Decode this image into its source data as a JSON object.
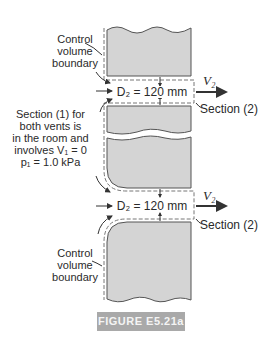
{
  "figure": {
    "caption": "FIGURE E5.21a",
    "labels": {
      "cv_top": [
        "Control",
        "volume",
        "boundary"
      ],
      "section1": [
        "Section (1) for",
        "both vents is",
        "in the room and",
        "involves V₁ = 0",
        "p₁ = 1.0 kPa"
      ],
      "cv_bottom": [
        "Control",
        "volume",
        "boundary"
      ],
      "d2_top": "D₂ = 120 mm",
      "d2_bottom": "D₂ = 120 mm",
      "v2_top": "V₂",
      "v2_bottom": "V₂",
      "section2_top": "Section (2)",
      "section2_bottom": "Section (2)"
    },
    "colors": {
      "wall_fill": "#d4d4d4",
      "wall_stroke": "#555555",
      "caption_bg": "#a9a9a9"
    }
  }
}
